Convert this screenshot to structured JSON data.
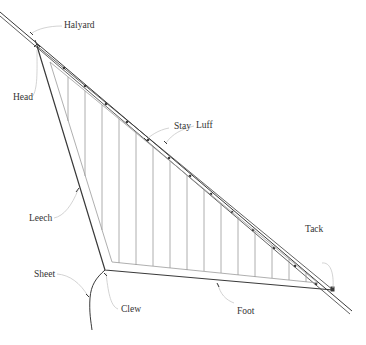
{
  "diagram": {
    "type": "sail-anatomy",
    "colors": {
      "line": "#3a3a3a",
      "light_line": "#9a9a9a",
      "leader": "#c8c8c8",
      "label": "#333333",
      "background": "#ffffff"
    },
    "labels": {
      "halyard": "Halyard",
      "head": "Head",
      "stay": "Stay",
      "luff": "Luff",
      "leech": "Leech",
      "tack": "Tack",
      "sheet": "Sheet",
      "clew": "Clew",
      "foot": "Foot"
    }
  }
}
